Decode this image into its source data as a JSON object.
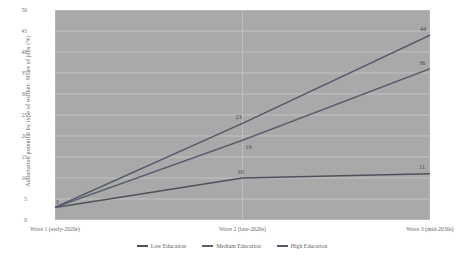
{
  "chart_data": {
    "type": "line",
    "title": "",
    "subtitle": "",
    "xlabel": "",
    "ylabel": "Automation potential by type of worker: Share of jobs (%)",
    "categories": [
      "Wave 1 (early-2020s)",
      "Wave 2 (late-2020s)",
      "Wave 3 (mid-2030s)"
    ],
    "series": [
      {
        "name": "Low Education",
        "values": [
          3,
          10,
          11
        ],
        "color": "#4d525c"
      },
      {
        "name": "Medium Education",
        "values": [
          3,
          19,
          36
        ],
        "color": "#5a6070"
      },
      {
        "name": "High Education",
        "values": [
          3,
          23,
          44
        ],
        "color": "#53586a"
      }
    ],
    "ylim": [
      0,
      50
    ],
    "yticks": [
      "0",
      "5",
      "10",
      "15",
      "20",
      "25",
      "30",
      "35",
      "40",
      "45",
      "50"
    ],
    "grid": true,
    "legend_position": "bottom-center",
    "plot_background": "#a9a9a9",
    "grid_color": "#d6d6d6",
    "annotations": [
      {
        "text": "3",
        "series": "shared",
        "category": "Wave 1 (early-2020s)"
      },
      {
        "text": "10",
        "series": "Low Education",
        "category": "Wave 2 (late-2020s)"
      },
      {
        "text": "11",
        "series": "Low Education",
        "category": "Wave 3 (mid-2030s)"
      },
      {
        "text": "19",
        "series": "Medium Education",
        "category": "Wave 2 (late-2020s)"
      },
      {
        "text": "36",
        "series": "Medium Education",
        "category": "Wave 3 (mid-2030s)"
      },
      {
        "text": "23",
        "series": "High Education",
        "category": "Wave 2 (late-2020s)"
      },
      {
        "text": "44",
        "series": "High Education",
        "category": "Wave 3 (mid-2030s)"
      }
    ]
  }
}
